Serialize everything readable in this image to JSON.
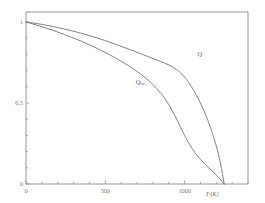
{
  "chart_data": {
    "type": "line",
    "title": "",
    "subtitle": "",
    "xlabel": "T (K)",
    "ylabel": "",
    "xlim": [
      0,
      1400
    ],
    "ylim": [
      0,
      1.05
    ],
    "grid": false,
    "legend_position": "inline-annotation",
    "x_ticks_major": [
      0,
      500,
      1000
    ],
    "x_tick_labels": [
      "0",
      "500",
      "1000"
    ],
    "x_ticks_minor_step": 100,
    "y_ticks_major": [
      0,
      0.5,
      1
    ],
    "y_tick_labels": [
      "0",
      "0.5",
      "1"
    ],
    "y_ticks_minor_step": 0.1,
    "annotations": [
      {
        "text": "Q",
        "subscript": "",
        "x": 1080,
        "y": 0.79
      },
      {
        "text": "Q",
        "subscript": "ref",
        "x": 690,
        "y": 0.62
      }
    ],
    "series": [
      {
        "name": "Q",
        "subscript": "",
        "color": "#6d6d6d",
        "x": [
          0,
          50,
          100,
          150,
          200,
          250,
          300,
          350,
          400,
          450,
          500,
          550,
          600,
          650,
          700,
          750,
          800,
          850,
          900,
          950,
          1000,
          1050,
          1100,
          1150,
          1200,
          1230,
          1250
        ],
        "y": [
          1.0,
          0.993,
          0.985,
          0.976,
          0.966,
          0.955,
          0.943,
          0.93,
          0.916,
          0.901,
          0.885,
          0.868,
          0.85,
          0.832,
          0.813,
          0.794,
          0.775,
          0.756,
          0.735,
          0.706,
          0.66,
          0.59,
          0.5,
          0.385,
          0.235,
          0.11,
          0.0
        ]
      },
      {
        "name": "Q_ref",
        "subscript": "ref",
        "color": "#6d6d6d",
        "x": [
          0,
          50,
          100,
          150,
          200,
          250,
          300,
          350,
          400,
          450,
          500,
          550,
          600,
          650,
          700,
          750,
          800,
          850,
          900,
          950,
          1000,
          1050,
          1100,
          1150,
          1200,
          1250
        ],
        "y": [
          1.0,
          0.986,
          0.971,
          0.955,
          0.938,
          0.92,
          0.901,
          0.881,
          0.859,
          0.836,
          0.812,
          0.786,
          0.758,
          0.728,
          0.695,
          0.658,
          0.614,
          0.56,
          0.49,
          0.4,
          0.3,
          0.215,
          0.152,
          0.102,
          0.055,
          0.0
        ]
      }
    ]
  }
}
